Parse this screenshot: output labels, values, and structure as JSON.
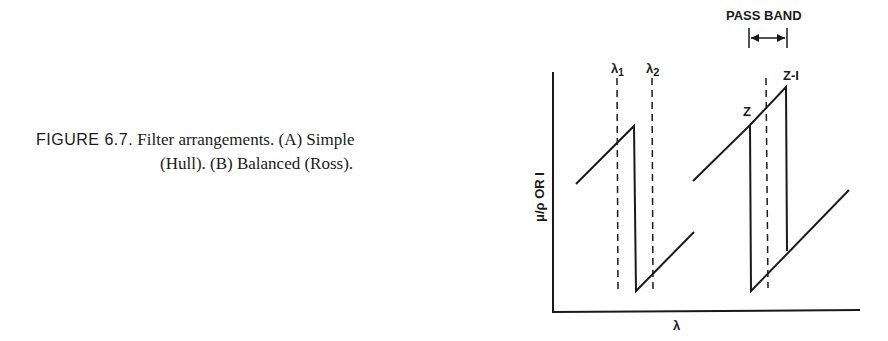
{
  "caption": {
    "figure_label": "FIGURE 6.7.",
    "line1_text": "Filter arrangements. (A) Simple",
    "line2_text": "(Hull). (B) Balanced (Ross)."
  },
  "diagram": {
    "y_axis_label": "μ/ρ OR I",
    "x_axis_label": "λ",
    "markers": {
      "lambda1": "λ",
      "lambda1_sub": "1",
      "lambda2": "λ",
      "lambda2_sub": "2"
    },
    "edge_labels": {
      "z": "Z",
      "z_minus_1": "Z-I"
    },
    "pass_band_label": "PASS BAND"
  },
  "colors": {
    "ink": "#1a1a1a",
    "background": "#ffffff"
  }
}
